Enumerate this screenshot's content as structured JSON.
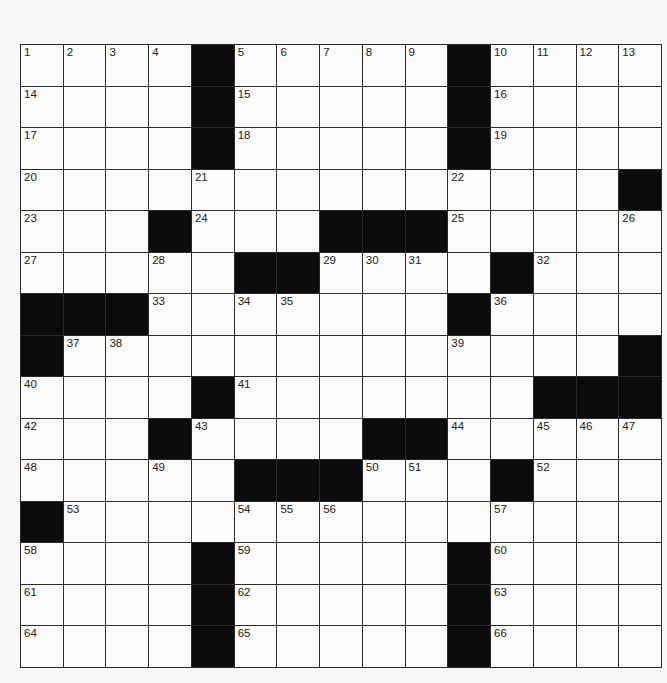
{
  "puzzle": {
    "rows": 15,
    "cols": 15,
    "colors": {
      "background": "#f7f7f5",
      "cell": "#fbfbf9",
      "block": "#0b0b0b",
      "gridline": "#2a2a2a",
      "number": "#222222"
    },
    "grid": [
      [
        "1",
        "2",
        "3",
        "4",
        "#",
        "5",
        "6",
        "7",
        "8",
        "9",
        "#",
        "10",
        "11",
        "12",
        "13"
      ],
      [
        "14",
        ".",
        ".",
        ".",
        "#",
        "15",
        ".",
        ".",
        ".",
        ".",
        "#",
        "16",
        ".",
        ".",
        "."
      ],
      [
        "17",
        ".",
        ".",
        ".",
        "#",
        "18",
        ".",
        ".",
        ".",
        ".",
        "#",
        "19",
        ".",
        ".",
        "."
      ],
      [
        "20",
        ".",
        ".",
        ".",
        "21",
        ".",
        ".",
        ".",
        ".",
        ".",
        "22",
        ".",
        ".",
        ".",
        "#"
      ],
      [
        "23",
        ".",
        ".",
        "#",
        "24",
        ".",
        ".",
        "#",
        "#",
        "#",
        "25",
        ".",
        ".",
        ".",
        "26"
      ],
      [
        "27",
        ".",
        ".",
        "28",
        ".",
        "#",
        "#",
        "29",
        "30",
        "31",
        ".",
        "#",
        "32",
        ".",
        "."
      ],
      [
        "#",
        "#",
        "#",
        "33",
        ".",
        "34",
        "35",
        ".",
        ".",
        ".",
        "#",
        "36",
        ".",
        ".",
        "."
      ],
      [
        "#",
        "37",
        "38",
        ".",
        ".",
        ".",
        ".",
        ".",
        ".",
        ".",
        "39",
        ".",
        ".",
        ".",
        "#"
      ],
      [
        "40",
        ".",
        ".",
        ".",
        "#",
        "41",
        ".",
        ".",
        ".",
        ".",
        ".",
        ".",
        "#",
        "#",
        "#"
      ],
      [
        "42",
        ".",
        ".",
        "#",
        "43",
        ".",
        ".",
        ".",
        "#",
        "#",
        "44",
        ".",
        "45",
        "46",
        "47"
      ],
      [
        "48",
        ".",
        ".",
        "49",
        ".",
        "#",
        "#",
        "#",
        "50",
        "51",
        ".",
        "#",
        "52",
        ".",
        "."
      ],
      [
        "#",
        "53",
        ".",
        ".",
        ".",
        "54",
        "55",
        "56",
        ".",
        ".",
        ".",
        "57",
        ".",
        ".",
        "."
      ],
      [
        "58",
        ".",
        ".",
        ".",
        "#",
        "59",
        ".",
        ".",
        ".",
        ".",
        "#",
        "60",
        ".",
        ".",
        "."
      ],
      [
        "61",
        ".",
        ".",
        ".",
        "#",
        "62",
        ".",
        ".",
        ".",
        ".",
        "#",
        "63",
        ".",
        ".",
        "."
      ],
      [
        "64",
        ".",
        ".",
        ".",
        "#",
        "65",
        ".",
        ".",
        ".",
        ".",
        "#",
        "66",
        ".",
        ".",
        "."
      ]
    ],
    "entries": {}
  }
}
